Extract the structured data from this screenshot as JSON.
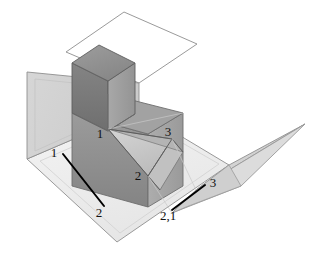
{
  "figure": {
    "background_color": "#ffffff",
    "type": "technical-drawing"
  },
  "colors": {
    "background": "#ffffff",
    "outline": "#6e6e6e",
    "outline_dark": "#3a3a3a",
    "plane_vertical_left": "#d2d2d2",
    "plane_vertical_upper": "#ffffff",
    "plane_ground": "#efefef",
    "plane_ground_band": "#e3e3e3",
    "flap_right": "#d8d8d8",
    "flap_right_dark": "#c6c6c6",
    "block_top": "#9a9a9a",
    "block_left": "#8c8c8c",
    "block_right": "#a6a6a6",
    "block_front_dark": "#8a8a8a",
    "cube_top": "#8f8f8f",
    "cube_left": "#777777",
    "cube_right": "#9d9d9d",
    "triangle_face": "#c9c9c9",
    "triangle_face_2": "#bdbdbd",
    "leader_line": "#000000",
    "label_text": "#111111"
  },
  "labels": {
    "solid": [
      {
        "id": "vertex-1-solid",
        "text": "1",
        "x": 103,
        "y": 137
      },
      {
        "id": "vertex-3-solid",
        "text": "3",
        "x": 168,
        "y": 135
      },
      {
        "id": "vertex-2-solid",
        "text": "2",
        "x": 137,
        "y": 179
      }
    ],
    "projection_left": [
      {
        "id": "proj-left-1",
        "text": "1",
        "x": 50,
        "y": 157
      },
      {
        "id": "proj-left-2",
        "text": "2",
        "x": 96,
        "y": 216
      }
    ],
    "projection_right": [
      {
        "id": "proj-right-3",
        "text": "3",
        "x": 210,
        "y": 189
      },
      {
        "id": "proj-right-21",
        "text": "2,1",
        "x": 159,
        "y": 219
      }
    ]
  },
  "leader_lines": [
    {
      "id": "leader-left",
      "from": {
        "x": 63,
        "y": 154
      },
      "to": {
        "x": 104,
        "y": 206
      }
    },
    {
      "id": "leader-right",
      "from": {
        "x": 172,
        "y": 210
      },
      "to": {
        "x": 205,
        "y": 185
      }
    }
  ],
  "geometry": {
    "plane_vertical_upper": "140,12 198,40 198,40 140,12",
    "plane_vertical_lower": "27,72 118,33 118,118 27,159",
    "ground_plane": "27,159 118,118 200,168 117,241",
    "right_flap": "200,168 305,124 241,186 186,207",
    "triangle_vertices": [
      {
        "label": "1",
        "x": 108,
        "y": 130
      },
      {
        "label": "2",
        "x": 148,
        "y": 176
      },
      {
        "label": "3",
        "x": 172,
        "y": 139
      }
    ]
  },
  "shape_description": {
    "solid": "L-shaped block consisting of a tall cubic riser at the back-left and a lower rectangular prism extending to the right",
    "planes": "Two mutually perpendicular projection planes forming a corner: a vertical plane at the left/back and a horizontal ground plane",
    "flap": "A folded-out profile plane extending to the right of the ground plane",
    "highlighted_face": "An oblique triangular face cut into the solid with vertices numbered 1, 2 and 3"
  }
}
